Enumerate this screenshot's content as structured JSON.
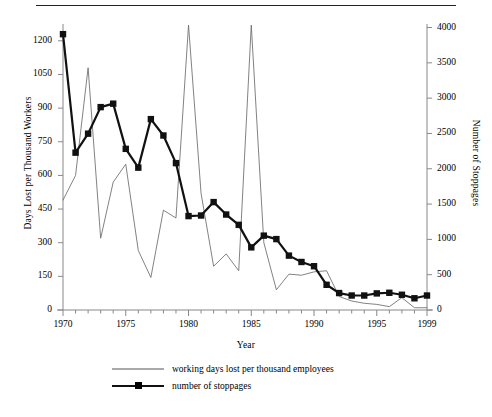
{
  "chart_data": {
    "type": "line",
    "title": "",
    "xlabel": "Year",
    "ylabel": "Days Lost per Thousand Workers",
    "y2label": "Number of Stoppages",
    "grid": false,
    "legend_position": "bottom",
    "x": [
      1970,
      1971,
      1972,
      1973,
      1974,
      1975,
      1976,
      1977,
      1978,
      1979,
      1980,
      1981,
      1982,
      1983,
      1984,
      1985,
      1986,
      1987,
      1988,
      1989,
      1990,
      1991,
      1992,
      1993,
      1994,
      1995,
      1996,
      1997,
      1998,
      1999
    ],
    "xlim": [
      1970,
      1999
    ],
    "ylim": [
      0,
      1275
    ],
    "y2lim": [
      0,
      4050
    ],
    "xticks": [
      1970,
      1975,
      1980,
      1985,
      1990,
      1995,
      1999
    ],
    "xtick_labels": [
      "1970",
      "1975",
      "1980",
      "1985",
      "1990",
      "1995",
      "1999"
    ],
    "xminorticks": [
      1971,
      1972,
      1973,
      1974,
      1976,
      1977,
      1978,
      1979,
      1981,
      1982,
      1983,
      1984,
      1986,
      1987,
      1988,
      1989,
      1991,
      1992,
      1993,
      1994,
      1996,
      1997,
      1998
    ],
    "yticks": [
      0,
      150,
      300,
      450,
      600,
      750,
      900,
      1050,
      1200
    ],
    "ytick_labels": [
      "0",
      "150",
      "300",
      "450",
      "600",
      "750",
      "900",
      "1050",
      "1200"
    ],
    "y2ticks": [
      0,
      500,
      1000,
      1500,
      2000,
      2500,
      3000,
      3500,
      4000
    ],
    "y2tick_labels": [
      "0",
      "500",
      "1000",
      "1500",
      "2000",
      "2500",
      "3000",
      "3500",
      "4000"
    ],
    "series": [
      {
        "name": "working days lost per thousand employees",
        "axis": "left",
        "style": "thin-line",
        "color": "#6b6b6b",
        "marker": "none",
        "values": [
          490,
          600,
          1080,
          320,
          570,
          650,
          265,
          145,
          445,
          410,
          1270,
          520,
          195,
          250,
          175,
          1270,
          300,
          90,
          160,
          155,
          170,
          175,
          60,
          40,
          30,
          25,
          15,
          55,
          10,
          10
        ]
      },
      {
        "name": "number of stoppages",
        "axis": "right",
        "style": "thick-line-markers",
        "color": "#111111",
        "marker": "square",
        "values": [
          3906,
          2228,
          2497,
          2873,
          2922,
          2282,
          2016,
          2703,
          2471,
          2080,
          1330,
          1338,
          1528,
          1352,
          1206,
          887,
          1053,
          1004,
          770,
          680,
          620,
          357,
          240,
          205,
          205,
          235,
          244,
          216,
          166,
          205
        ]
      }
    ]
  },
  "figure": {
    "top_rule": true,
    "xlabel": "Year",
    "ylabel_left": "Days Lost per Thousand Workers",
    "ylabel_right": "Number of Stoppages",
    "legend": [
      {
        "label": "working days lost per thousand employees",
        "marker": "none",
        "line": "thin"
      },
      {
        "label": "number of stoppages",
        "marker": "square",
        "line": "thick"
      }
    ]
  }
}
